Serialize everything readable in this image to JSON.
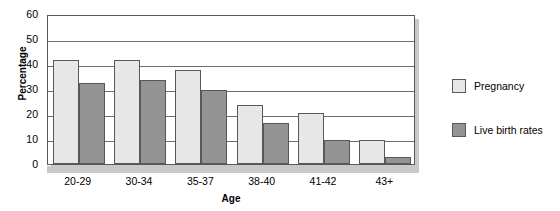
{
  "chart_data": {
    "type": "bar",
    "title": "",
    "xlabel": "Age",
    "ylabel": "Percentage",
    "categories": [
      "20-29",
      "30-34",
      "35-37",
      "38-40",
      "41-42",
      "43+"
    ],
    "series": [
      {
        "name": "Pregnancy",
        "color": "#e7e7e7",
        "values": [
          41.5,
          41.5,
          37.5,
          23.5,
          20.5,
          9.5
        ]
      },
      {
        "name": "Live birth rates",
        "color": "#949494",
        "values": [
          32.5,
          33.5,
          29.5,
          16.5,
          9.5,
          3.0
        ]
      }
    ],
    "ylim": [
      0,
      60
    ],
    "yticks": [
      0,
      10,
      20,
      30,
      40,
      50,
      60
    ],
    "ytick_labels": [
      "0",
      "10",
      "20",
      "30",
      "40",
      "50",
      "60"
    ],
    "grid": true,
    "legend_position": "right"
  },
  "legend": {
    "entries": [
      {
        "label": "Pregnancy"
      },
      {
        "label": "Live birth rates"
      }
    ]
  },
  "colors": {
    "series_light": "#e7e7e7",
    "series_dark": "#949494",
    "frame": "#58585a",
    "gridline": "#6e6e70",
    "shadow": "#c9c9c9"
  }
}
